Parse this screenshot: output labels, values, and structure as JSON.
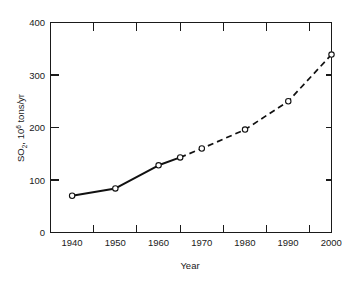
{
  "chart_data": {
    "type": "line",
    "title": "",
    "subtitle": "",
    "xlabel": "Year",
    "ylabel": "SO2, 10^6 tons/yr",
    "ylabel_parts": {
      "base": "SO",
      "subscript": "2",
      "middle": ", 10",
      "superscript": "6",
      "tail": " tons/yr"
    },
    "xlim": [
      1935,
      2000
    ],
    "ylim": [
      0,
      400
    ],
    "xticks": [
      1940,
      1950,
      1960,
      1970,
      1980,
      1990,
      2000
    ],
    "xtick_labels": [
      "1940",
      "1950",
      "1960",
      "1970",
      "1980",
      "1990",
      "2000"
    ],
    "xminor_ticks": [
      1945,
      1955,
      1965,
      1975,
      1985,
      1995
    ],
    "yticks": [
      0,
      100,
      200,
      300,
      400
    ],
    "ytick_labels": [
      "0",
      "100",
      "200",
      "300",
      "400"
    ],
    "grid": false,
    "legend": null,
    "x": [
      1940,
      1950,
      1960,
      1965,
      1970,
      1980,
      1990,
      2000
    ],
    "y": [
      70,
      84,
      128,
      143,
      160,
      196,
      250,
      339
    ],
    "series": [
      {
        "name": "Historical (measured)",
        "style": "solid",
        "marker": "open-circle",
        "x": [
          1940,
          1950,
          1960,
          1965
        ],
        "values": [
          70,
          84,
          128,
          143
        ]
      },
      {
        "name": "Projected",
        "style": "dashed",
        "marker": "open-circle",
        "x": [
          1965,
          1970,
          1980,
          1990,
          2000
        ],
        "values": [
          143,
          160,
          196,
          250,
          339
        ]
      }
    ]
  },
  "figure": {
    "background_color": "#ffffff",
    "line_color": "#111111",
    "axis_color": "#1a1a1a",
    "marker_fill": "#ffffff"
  }
}
